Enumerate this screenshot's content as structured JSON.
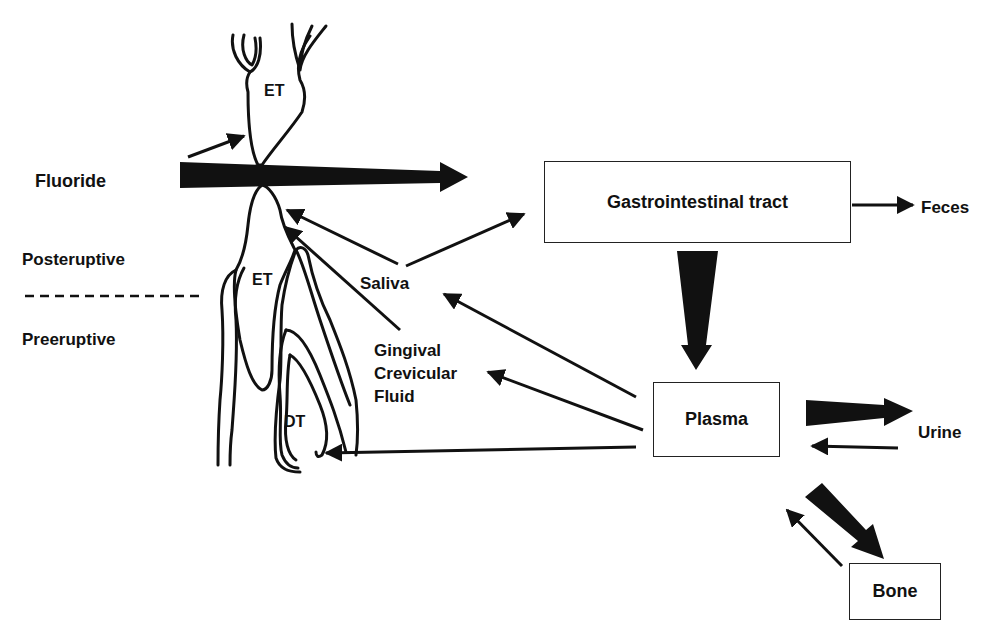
{
  "diagram": {
    "type": "fluoride-metabolism-flow",
    "labels": {
      "fluoride": "Fluoride",
      "posteruptive": "Posteruptive",
      "preeruptive": "Preeruptive",
      "erupted_tooth_upper": "ET",
      "erupted_tooth_lower": "ET",
      "developing_tooth": "DT",
      "saliva": "Saliva",
      "gcf_line1": "Gingival",
      "gcf_line2": "Crevicular",
      "gcf_line3": "Fluid",
      "feces": "Feces",
      "urine": "Urine"
    },
    "boxes": {
      "gi_tract": "Gastrointestinal tract",
      "plasma": "Plasma",
      "bone": "Bone"
    },
    "colors": {
      "ink": "#111111",
      "box_border": "#222222",
      "background": "#ffffff"
    },
    "flows": [
      {
        "from": "Fluoride",
        "to": "Gastrointestinal tract",
        "weight": "large"
      },
      {
        "from": "Fluoride",
        "to": "ET (upper)",
        "weight": "small"
      },
      {
        "from": "Gastrointestinal tract",
        "to": "Feces",
        "weight": "small"
      },
      {
        "from": "Gastrointestinal tract",
        "to": "Plasma",
        "weight": "large"
      },
      {
        "from": "Saliva",
        "to": "Gastrointestinal tract",
        "weight": "small"
      },
      {
        "from": "Saliva",
        "to": "ET (lower)",
        "weight": "small"
      },
      {
        "from": "Gingival Crevicular Fluid",
        "to": "ET (lower)",
        "weight": "small"
      },
      {
        "from": "Plasma",
        "to": "Saliva",
        "weight": "small"
      },
      {
        "from": "Plasma",
        "to": "Gingival Crevicular Fluid",
        "weight": "small"
      },
      {
        "from": "Plasma",
        "to": "DT",
        "weight": "small"
      },
      {
        "from": "Plasma",
        "to": "Urine",
        "weight": "large"
      },
      {
        "from": "Urine",
        "to": "Plasma",
        "weight": "small"
      },
      {
        "from": "Plasma",
        "to": "Bone",
        "weight": "large"
      },
      {
        "from": "Bone",
        "to": "Plasma",
        "weight": "small"
      }
    ]
  }
}
